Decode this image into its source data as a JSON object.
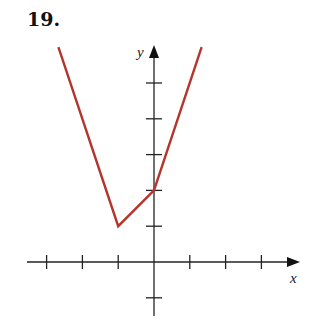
{
  "problem_number": "19.",
  "chart_data": {
    "type": "line",
    "title": "",
    "xlabel": "x",
    "ylabel": "y",
    "xlim": [
      -3.5,
      4
    ],
    "ylim": [
      -1.5,
      6
    ],
    "grid": false,
    "x_ticks": [
      -3,
      -2,
      -1,
      1,
      2,
      3
    ],
    "y_ticks": [
      -1,
      1,
      2,
      3,
      4,
      5
    ],
    "tick_labels_shown": false,
    "series": [
      {
        "name": "piecewise function",
        "color": "#b5342c",
        "points": [
          [
            -2.67,
            6
          ],
          [
            -1,
            1
          ],
          [
            0,
            2
          ],
          [
            1.33,
            6
          ]
        ]
      }
    ]
  },
  "colors": {
    "curve": "#b5342c",
    "axis": "#222222"
  }
}
